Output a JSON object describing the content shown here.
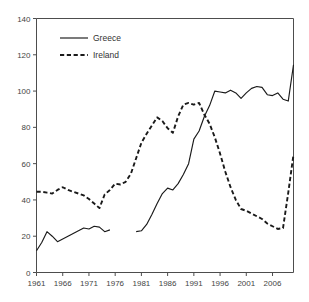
{
  "chart_data": {
    "type": "line",
    "title": "",
    "subtitle": "",
    "xlabel": "",
    "ylabel": "",
    "xlim": [
      1961,
      2010
    ],
    "ylim": [
      0,
      140
    ],
    "yticks": [
      0,
      20,
      40,
      60,
      80,
      100,
      120,
      140
    ],
    "xticks": [
      1961,
      1966,
      1971,
      1976,
      1981,
      1986,
      1991,
      1996,
      2001,
      2006
    ],
    "ytick_labels": [
      "0",
      "20",
      "40",
      "60",
      "80",
      "100",
      "120",
      "140"
    ],
    "xtick_labels": [
      "1961",
      "1966",
      "1971",
      "1976",
      "1981",
      "1986",
      "1991",
      "1996",
      "2001",
      "2006"
    ],
    "grid": false,
    "legend_position": "top-left-inside",
    "series": [
      {
        "name": "Greece",
        "style": "solid",
        "color": "#1a1a1a",
        "x": [
          1961,
          1962,
          1963,
          1964,
          1965,
          1966,
          1967,
          1968,
          1969,
          1970,
          1971,
          1972,
          1973,
          1974,
          1975,
          1980,
          1981,
          1982,
          1983,
          1984,
          1985,
          1986,
          1987,
          1988,
          1989,
          1990,
          1991,
          1992,
          1993,
          1994,
          1995,
          1996,
          1997,
          1998,
          1999,
          2000,
          2001,
          2002,
          2003,
          2004,
          2005,
          2006,
          2007,
          2008,
          2009,
          2010
        ],
        "values": [
          12,
          16.5,
          22.5,
          20,
          17,
          18.5,
          20,
          21.5,
          23,
          24.5,
          24,
          25.5,
          25,
          22.5,
          23.5,
          22.5,
          23,
          26.5,
          32,
          38,
          43.5,
          46.5,
          45.5,
          49,
          54,
          60,
          73.5,
          78,
          86,
          92,
          100,
          99.5,
          99,
          100.5,
          99,
          96,
          99,
          101.5,
          102.5,
          102,
          98,
          97.5,
          99,
          95.5,
          94.5,
          114.5
        ]
      },
      {
        "name": "Ireland",
        "style": "dashed",
        "color": "#1a1a1a",
        "x": [
          1961,
          1962,
          1963,
          1964,
          1965,
          1966,
          1967,
          1968,
          1969,
          1970,
          1971,
          1972,
          1973,
          1974,
          1975,
          1976,
          1977,
          1978,
          1979,
          1980,
          1981,
          1982,
          1983,
          1984,
          1985,
          1986,
          1987,
          1988,
          1989,
          1990,
          1991,
          1992,
          1993,
          1994,
          1995,
          1996,
          1997,
          1998,
          1999,
          2000,
          2001,
          2002,
          2003,
          2004,
          2005,
          2006,
          2007,
          2008,
          2009,
          2010
        ],
        "values": [
          44.5,
          44.5,
          44,
          43.5,
          45.5,
          47,
          45.5,
          44.5,
          43.5,
          42.5,
          40.5,
          38,
          35.5,
          43,
          45.5,
          49,
          48.5,
          50,
          54.5,
          63,
          71.5,
          76.5,
          81,
          85.5,
          83.5,
          79.5,
          77,
          86,
          92.5,
          93.5,
          92.5,
          93.5,
          87,
          82,
          74.5,
          65.5,
          55.5,
          47,
          40,
          35,
          34,
          32.5,
          31,
          29.5,
          27,
          25.5,
          24,
          24.5,
          44,
          65
        ]
      }
    ],
    "legend": [
      "Greece",
      "Ireland"
    ]
  }
}
